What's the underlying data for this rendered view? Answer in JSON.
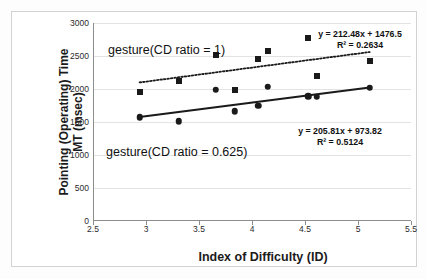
{
  "chart_data": {
    "type": "scatter",
    "title": "",
    "xlabel": "Index of Difficulty (ID)",
    "ylabel": "Pointing (Operating) Time MT (msec)",
    "ylabel_line1": "Pointing (Operating) Time",
    "ylabel_line2": "MT (msec)",
    "xlim": [
      2.5,
      5.5
    ],
    "ylim": [
      0,
      3000
    ],
    "xticks": [
      "2.5",
      "3",
      "3.5",
      "4",
      "4.5",
      "5",
      "5.5"
    ],
    "xtick_values": [
      2.5,
      3,
      3.5,
      4,
      4.5,
      5,
      5.5
    ],
    "yticks": [
      "0",
      "500",
      "1000",
      "1500",
      "2000",
      "2500",
      "3000"
    ],
    "ytick_values": [
      0,
      500,
      1000,
      1500,
      2000,
      2500,
      3000
    ],
    "grid": "horizontal",
    "legend_position": "inline-annotations",
    "series": [
      {
        "name": "gesture(CD ratio = 1)",
        "marker": "square",
        "color": "#1a1a1a",
        "trendline_style": "dotted",
        "equation": "y = 212.48x + 1476.5",
        "r_squared": "R² = 0.2634",
        "slope": 212.48,
        "intercept": 1476.5,
        "points": [
          {
            "x": 2.93,
            "y": 1960
          },
          {
            "x": 3.3,
            "y": 2120
          },
          {
            "x": 3.65,
            "y": 2520
          },
          {
            "x": 3.83,
            "y": 1980
          },
          {
            "x": 4.05,
            "y": 2460
          },
          {
            "x": 4.14,
            "y": 2580
          },
          {
            "x": 4.52,
            "y": 2770
          },
          {
            "x": 4.6,
            "y": 2200
          },
          {
            "x": 5.1,
            "y": 2420
          }
        ]
      },
      {
        "name": "gesture(CD ratio = 0.625)",
        "marker": "circle",
        "color": "#1a1a1a",
        "trendline_style": "solid",
        "equation": "y = 205.81x + 973.82",
        "r_squared": "R² = 0.5124",
        "slope": 205.81,
        "intercept": 973.82,
        "points": [
          {
            "x": 2.93,
            "y": 1570
          },
          {
            "x": 3.3,
            "y": 1510
          },
          {
            "x": 3.65,
            "y": 1990
          },
          {
            "x": 3.83,
            "y": 1660
          },
          {
            "x": 4.05,
            "y": 1745
          },
          {
            "x": 4.14,
            "y": 2035
          },
          {
            "x": 4.52,
            "y": 1890
          },
          {
            "x": 4.6,
            "y": 1880
          },
          {
            "x": 5.1,
            "y": 2020
          }
        ]
      }
    ],
    "annotations": [
      {
        "name": "series-label-cd1",
        "text": "gesture(CD ratio = 1)"
      },
      {
        "name": "series-label-cd0625",
        "text": "gesture(CD ratio = 0.625)"
      },
      {
        "name": "equation-cd1-line1",
        "text": "y = 212.48x + 1476.5"
      },
      {
        "name": "equation-cd1-line2",
        "text": "R² = 0.2634"
      },
      {
        "name": "equation-cd0625-line1",
        "text": "y = 205.81x + 973.82"
      },
      {
        "name": "equation-cd0625-line2",
        "text": "R² = 0.5124"
      }
    ]
  }
}
